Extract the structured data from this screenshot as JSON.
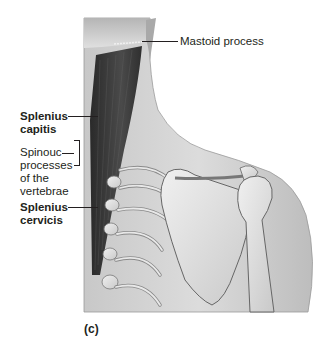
{
  "figure": {
    "panel": "(c)",
    "labels": {
      "mastoid_process": "Mastoid process",
      "splenius_capitis": [
        "Splenius",
        "capitis"
      ],
      "spinous_processes": [
        "Spinouc",
        "processes",
        "of the",
        "vertebrae"
      ],
      "splenius_cervicis": [
        "Splenius",
        "cervicis"
      ]
    },
    "colors": {
      "background": "#ffffff",
      "skin": "#d9d9d9",
      "muscle": "#3a3a3a",
      "bone": "#e4e4e4",
      "outline": "#555555",
      "text": "#231f20"
    }
  }
}
